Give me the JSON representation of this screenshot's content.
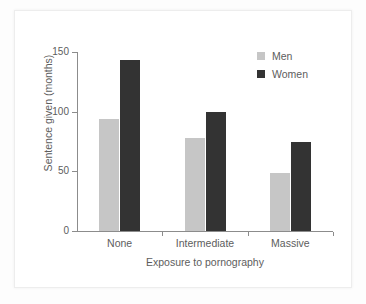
{
  "chart_data": {
    "type": "bar",
    "title": "",
    "xlabel": "Exposure to pornography",
    "ylabel": "Sentence given (months)",
    "categories": [
      "None",
      "Intermediate",
      "Massive"
    ],
    "series": [
      {
        "name": "Men",
        "color": "#c6c6c6",
        "values": [
          94,
          78,
          49
        ]
      },
      {
        "name": "Women",
        "color": "#333333",
        "values": [
          143,
          100,
          75
        ]
      }
    ],
    "ylim": [
      0,
      150
    ],
    "yticks": [
      0,
      50,
      100,
      150
    ],
    "ytick_labels": [
      "0",
      "50",
      "100",
      "150"
    ],
    "grid": false,
    "legend_position": "top-right"
  }
}
